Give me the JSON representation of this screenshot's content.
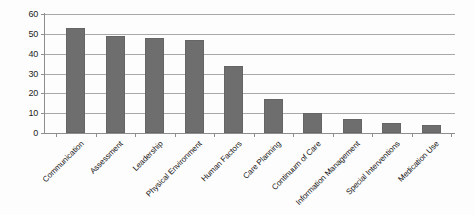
{
  "chart_data": {
    "type": "bar",
    "title": "",
    "subtitle": "",
    "xlabel": "",
    "ylabel": "",
    "ylim": [
      0,
      60
    ],
    "ytick_values": [
      0,
      10,
      20,
      30,
      40,
      50,
      60
    ],
    "ytick_labels": [
      "0",
      "10",
      "20",
      "30",
      "40",
      "50",
      "60"
    ],
    "grid": true,
    "legend": false,
    "legend_position": "none",
    "bar_color": "#6e6e6e",
    "gridline_color": "#a8a8a8",
    "axis_color": "#8e8e8e",
    "background_color": "#fdfdfd",
    "categories": [
      "Communication",
      "Assessment",
      "Leadership",
      "Physical Environment",
      "Human Factors",
      "Care Planning",
      "Continuum of Care",
      "Information Management",
      "Special Interventions",
      "Medication Use"
    ],
    "values": [
      53,
      49,
      48,
      47,
      34,
      17,
      10,
      7,
      5,
      4
    ]
  }
}
